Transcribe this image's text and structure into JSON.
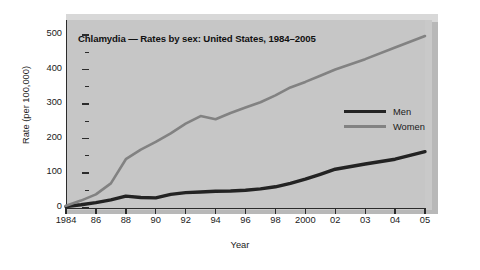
{
  "chart_data": {
    "type": "line",
    "title": "Chlamydia — Rates by sex: United States, 1984–2005",
    "xlabel": "Year",
    "ylabel": "Rate (per 100,000)",
    "ylim": [
      0,
      500
    ],
    "yticks": [
      0,
      100,
      200,
      300,
      400,
      500
    ],
    "ytick_labels": [
      "0",
      "100",
      "200",
      "300",
      "400",
      "500"
    ],
    "minor_yticks": [
      50,
      150,
      250,
      350,
      450
    ],
    "x": [
      1984,
      1985,
      1986,
      1987,
      1988,
      1989,
      1990,
      1991,
      1992,
      1993,
      1994,
      1995,
      1996,
      1997,
      1998,
      1999,
      2000,
      2001,
      2002,
      2003,
      2004,
      2005
    ],
    "xtick_values": [
      1984,
      1986,
      1988,
      1990,
      1992,
      1994,
      1996,
      1998,
      2000,
      2002,
      2003,
      2004,
      2005
    ],
    "xtick_labels": [
      "1984",
      "86",
      "88",
      "90",
      "92",
      "94",
      "96",
      "98",
      "2000",
      "02",
      "03",
      "04",
      "05"
    ],
    "grid": false,
    "legend_position": "center-right",
    "series": [
      {
        "name": "Men",
        "color": "#232323",
        "values": [
          3,
          8,
          14,
          22,
          33,
          29,
          28,
          38,
          43,
          45,
          47,
          48,
          50,
          54,
          60,
          70,
          82,
          96,
          111,
          126,
          140,
          162
        ]
      },
      {
        "name": "Women",
        "color": "#828282",
        "values": [
          5,
          20,
          38,
          70,
          140,
          168,
          190,
          215,
          243,
          265,
          256,
          274,
          290,
          305,
          325,
          348,
          364,
          382,
          400,
          430,
          464,
          497
        ]
      }
    ]
  },
  "legend": {
    "items": [
      {
        "label": "Men"
      },
      {
        "label": "Women"
      }
    ]
  }
}
